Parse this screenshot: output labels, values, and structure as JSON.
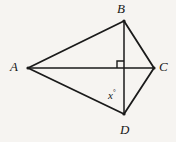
{
  "figure": {
    "type": "geometry-diagram",
    "background_color": "#f6f4f1",
    "stroke_color": "#1a1a1a",
    "width": 176,
    "height": 142
  },
  "vertices": [
    {
      "id": "A",
      "label": "A",
      "x": 28,
      "y": 68,
      "label_x": 10,
      "label_y": 60
    },
    {
      "id": "B",
      "label": "B",
      "x": 124,
      "y": 21,
      "label_x": 117,
      "label_y": 2
    },
    {
      "id": "C",
      "label": "C",
      "x": 154,
      "y": 68,
      "label_x": 159,
      "label_y": 60
    },
    {
      "id": "D",
      "label": "D",
      "x": 124,
      "y": 114,
      "label_x": 120,
      "label_y": 123
    }
  ],
  "segments": [
    {
      "id": "AB",
      "from": "A",
      "to": "B",
      "x1": 28,
      "y1": 68,
      "x2": 124,
      "y2": 21
    },
    {
      "id": "BC",
      "from": "B",
      "to": "C",
      "x1": 124,
      "y1": 21,
      "x2": 154,
      "y2": 68
    },
    {
      "id": "CD",
      "from": "C",
      "to": "D",
      "x1": 154,
      "y1": 68,
      "x2": 124,
      "y2": 114
    },
    {
      "id": "DA",
      "from": "D",
      "to": "A",
      "x1": 124,
      "y1": 114,
      "x2": 28,
      "y2": 68
    },
    {
      "id": "AC",
      "from": "A",
      "to": "C",
      "x1": 28,
      "y1": 68,
      "x2": 154,
      "y2": 68
    },
    {
      "id": "BD",
      "from": "B",
      "to": "D",
      "x1": 124,
      "y1": 21,
      "x2": 124,
      "y2": 114
    }
  ],
  "markers": {
    "right_angle": {
      "name": "right-angle-mark",
      "at_x": 124,
      "at_y": 68,
      "size": 7,
      "quadrant": "upper-left",
      "points": "117,68 117,61 124,61"
    }
  },
  "angle_labels": [
    {
      "id": "x-angle",
      "variable": "x",
      "degree_symbol": "°",
      "at_vertex": "D",
      "label_x": 108,
      "label_y": 89
    }
  ]
}
